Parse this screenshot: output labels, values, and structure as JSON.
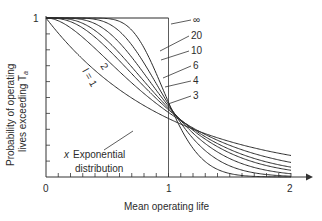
{
  "chart_data": {
    "type": "line",
    "title": "",
    "xlabel": "Mean operating life",
    "ylabel_line1": "Probability of operating",
    "ylabel_line2": "lives exceeding T",
    "ylabel_subscript": "a",
    "xlim": [
      0,
      2
    ],
    "ylim": [
      0,
      1
    ],
    "x_ticks": [
      "0",
      "1",
      "2"
    ],
    "y_ticks": [
      "1"
    ],
    "x_minor_tick_step": 0.1,
    "y_minor_tick_step": 0.1,
    "grid": false,
    "reference_line_x": 1,
    "annotation": {
      "marker": "x",
      "text_line1": "Exponential",
      "text_line2": "distribution",
      "points_to": "l = 1"
    },
    "x": [
      0,
      0.25,
      0.5,
      0.75,
      1.0,
      1.25,
      1.5,
      1.75,
      2.0
    ],
    "series": [
      {
        "name": "l = 1",
        "label": "l = 1",
        "values": [
          1.0,
          0.779,
          0.607,
          0.472,
          0.368,
          0.287,
          0.223,
          0.174,
          0.135
        ]
      },
      {
        "name": "2",
        "label": "2",
        "values": [
          1.0,
          0.91,
          0.736,
          0.558,
          0.406,
          0.287,
          0.199,
          0.136,
          0.092
        ]
      },
      {
        "name": "3",
        "label": "3",
        "values": [
          1.0,
          0.96,
          0.809,
          0.61,
          0.423,
          0.277,
          0.174,
          0.106,
          0.062
        ]
      },
      {
        "name": "4",
        "label": "4",
        "values": [
          1.0,
          0.981,
          0.857,
          0.647,
          0.433,
          0.265,
          0.151,
          0.082,
          0.042
        ]
      },
      {
        "name": "6",
        "label": "6",
        "values": [
          1.0,
          0.996,
          0.916,
          0.703,
          0.446,
          0.241,
          0.116,
          0.05,
          0.02
        ]
      },
      {
        "name": "10",
        "label": "10",
        "values": [
          1.0,
          1.0,
          0.968,
          0.776,
          0.458,
          0.201,
          0.07,
          0.02,
          0.005
        ]
      },
      {
        "name": "20",
        "label": "20",
        "values": [
          1.0,
          1.0,
          0.995,
          0.857,
          0.47,
          0.142,
          0.025,
          0.003,
          0.0003
        ]
      },
      {
        "name": "∞",
        "label": "∞",
        "values": [
          1.0,
          1.0,
          1.0,
          1.0,
          1.0,
          0,
          0,
          0,
          0
        ]
      }
    ],
    "legend_position": "right-of-curves (leader lines)"
  }
}
